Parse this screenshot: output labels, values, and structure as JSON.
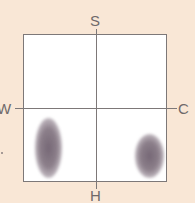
{
  "diagram": {
    "type": "quadrant-map",
    "axes": {
      "top_label": "S",
      "bottom_label": "H",
      "left_label": "W",
      "right_label": "C"
    },
    "regions": [
      {
        "name": "cluster-1",
        "quadrant": "bottom-left",
        "shape": "vertical-ellipse"
      },
      {
        "name": "cluster-2",
        "quadrant": "bottom-right",
        "shape": "vertical-ellipse"
      }
    ],
    "colors": {
      "background": "#f9e7d6",
      "plot_area": "#ffffff",
      "axis_line": "#7d7878",
      "label_text": "#6f6a6a",
      "cluster": "#786978"
    }
  }
}
